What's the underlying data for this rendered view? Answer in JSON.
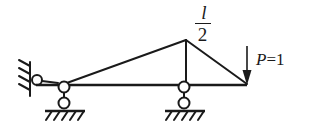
{
  "figure": {
    "stroke_color": "#1a1a1a",
    "background_color": "#ffffff"
  },
  "labels": {
    "span_label": {
      "numerator": "l",
      "bar": "",
      "denominator": "2",
      "full_text": "l/2"
    },
    "load_label": {
      "symbol": "P",
      "equals": "=1",
      "full_text": "P =1"
    }
  },
  "diagram_data": {
    "type": "structural-diagram",
    "description": "Simply supported beam with triangular influence line and unit point load",
    "baseline": {
      "x1": 36,
      "y": 85,
      "x2": 247
    },
    "influence_line": {
      "points": [
        {
          "x": 64,
          "y": 85,
          "name": "left-support-node"
        },
        {
          "x": 186,
          "y": 40,
          "name": "apex-node"
        },
        {
          "x": 247,
          "y": 85,
          "name": "right-end-node"
        }
      ]
    },
    "apex_vertical": {
      "x": 186,
      "y1": 40,
      "y2": 85
    },
    "wall": {
      "x": 30,
      "y1": 62,
      "y2": 96,
      "hatch_count": 4,
      "name": "fixed-wall-hatching"
    },
    "pin_link": {
      "cx": 37,
      "cy": 80,
      "r": 5
    },
    "supports": [
      {
        "name": "left-roller-support",
        "cx": 64,
        "top_cy": 86,
        "bottom_cy": 103,
        "r": 5,
        "ground_y": 112,
        "ground_x1": 45,
        "ground_x2": 85,
        "hatch_count": 5
      },
      {
        "name": "mid-roller-support",
        "cx": 184,
        "top_cy": 86,
        "bottom_cy": 103,
        "r": 5,
        "ground_y": 112,
        "ground_x1": 165,
        "ground_x2": 205,
        "hatch_count": 5
      }
    ],
    "load_arrow": {
      "x": 247,
      "y1": 47,
      "y2": 85,
      "direction": "down",
      "magnitude": 1
    }
  }
}
